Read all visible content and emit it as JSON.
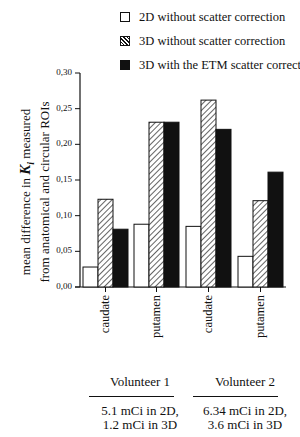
{
  "chart_data": {
    "type": "bar",
    "title": "",
    "xlabel": "",
    "ylabel": "mean difference in K_i measured from anatomical and circular ROIs",
    "ylabel_lines": [
      "mean difference in",
      "K",
      "i",
      "measured",
      "from anatomical and circular ROIs"
    ],
    "ylim": [
      0,
      0.3
    ],
    "yticks": [
      "0,00",
      "0,05",
      "0,10",
      "0,15",
      "0,20",
      "0,25",
      "0,30"
    ],
    "categories": [
      "caudate",
      "putamen",
      "caudate",
      "putamen"
    ],
    "groups": [
      {
        "label": "Volunteer 1",
        "dose_line1": "5.1 mCi in 2D,",
        "dose_line2": "1.2 mCi in 3D",
        "categories": [
          "caudate",
          "putamen"
        ]
      },
      {
        "label": "Volunteer 2",
        "dose_line1": "6.34 mCi in 2D,",
        "dose_line2": "3.6 mCi in 3D",
        "categories": [
          "caudate",
          "putamen"
        ]
      }
    ],
    "series": [
      {
        "name": "2D without scatter correction",
        "fill": "white",
        "values": [
          0.028,
          0.088,
          0.085,
          0.043
        ]
      },
      {
        "name": "3D without scatter correction",
        "fill": "hatched",
        "values": [
          0.123,
          0.231,
          0.262,
          0.121
        ]
      },
      {
        "name": "3D with the ETM scatter correction",
        "fill": "black",
        "values": [
          0.081,
          0.231,
          0.221,
          0.161
        ]
      }
    ],
    "legend_position": "top-right",
    "grid": false
  },
  "legend": {
    "items": [
      {
        "label": "2D without scatter correction"
      },
      {
        "label": "3D without scatter correction"
      },
      {
        "label": "3D with the ETM scatter correction"
      }
    ]
  },
  "axis": {
    "ylabel_part1": "mean difference in",
    "ylabel_symbol": "K",
    "ylabel_sub": "i",
    "ylabel_part2": "measured",
    "ylabel_line2": "from anatomical and circular ROIs"
  },
  "colors": {
    "ink": "#111111",
    "background": "#ffffff"
  }
}
